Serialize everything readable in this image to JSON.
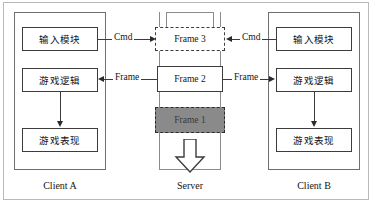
{
  "diagram": {
    "columns": [
      {
        "id": "client-a",
        "caption": "Client A",
        "modules": [
          {
            "id": "input-module",
            "label": "输入模块"
          },
          {
            "id": "game-logic",
            "label": "游戏逻辑"
          },
          {
            "id": "game-presentation",
            "label": "游戏表现"
          }
        ]
      },
      {
        "id": "server",
        "caption": "Server",
        "frames": [
          {
            "id": "frame-3",
            "label": "Frame 3",
            "style": "dashed",
            "fill": "#ffffff"
          },
          {
            "id": "frame-2",
            "label": "Frame 2",
            "style": "solid",
            "fill": "#ffffff"
          },
          {
            "id": "frame-1",
            "label": "Frame 1",
            "style": "dashed",
            "fill": "#8a8a8a"
          }
        ]
      },
      {
        "id": "client-b",
        "caption": "Client B",
        "modules": [
          {
            "id": "input-module",
            "label": "输入模块"
          },
          {
            "id": "game-logic",
            "label": "游戏逻辑"
          },
          {
            "id": "game-presentation",
            "label": "游戏表现"
          }
        ]
      }
    ],
    "edges": [
      {
        "id": "cmd-a-to-server",
        "label": "Cmd",
        "from": "client-a.input-module",
        "to": "server.frame-3",
        "direction": "right"
      },
      {
        "id": "cmd-b-to-server",
        "label": "Cmd",
        "from": "client-b.input-module",
        "to": "server.frame-3",
        "direction": "left"
      },
      {
        "id": "frame-server-to-a",
        "label": "Frame",
        "from": "server.frame-2",
        "to": "client-a.game-logic",
        "direction": "left"
      },
      {
        "id": "frame-server-to-b",
        "label": "Frame",
        "from": "server.frame-2",
        "to": "client-b.game-logic",
        "direction": "right"
      },
      {
        "id": "logic-to-view-a",
        "label": "",
        "from": "client-a.game-logic",
        "to": "client-a.game-presentation",
        "direction": "down"
      },
      {
        "id": "logic-to-view-b",
        "label": "",
        "from": "client-b.game-logic",
        "to": "client-b.game-presentation",
        "direction": "down"
      },
      {
        "id": "frame-dispatch",
        "label": "",
        "from": "server.frame-1",
        "to": "downstream",
        "direction": "down"
      }
    ],
    "colors": {
      "stroke": "#3c3c3c",
      "frame_highlight_fill": "#8a8a8a",
      "page_border": "#b9b9b9",
      "background": "#ffffff"
    }
  }
}
